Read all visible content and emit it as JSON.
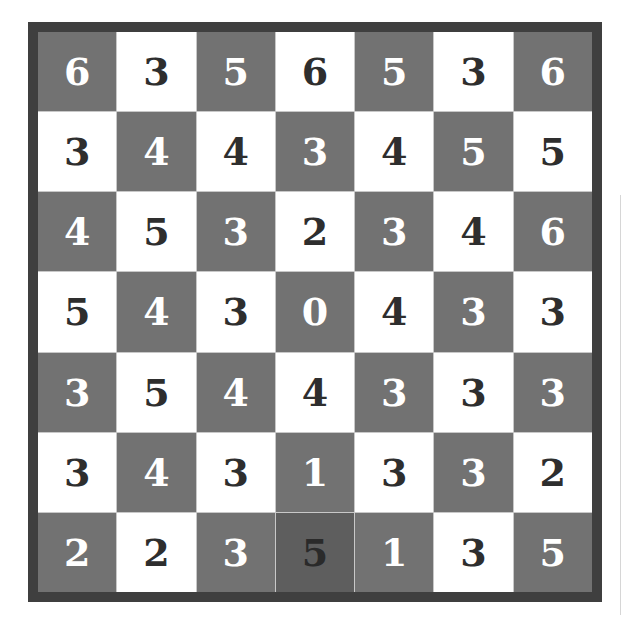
{
  "board": {
    "rows": 7,
    "cols": 7,
    "values": [
      [
        6,
        3,
        5,
        6,
        5,
        3,
        6
      ],
      [
        3,
        4,
        4,
        3,
        4,
        5,
        5
      ],
      [
        4,
        5,
        3,
        2,
        3,
        4,
        6
      ],
      [
        5,
        4,
        3,
        0,
        4,
        3,
        3
      ],
      [
        3,
        5,
        4,
        4,
        3,
        3,
        3
      ],
      [
        3,
        4,
        3,
        1,
        3,
        3,
        2
      ],
      [
        2,
        2,
        3,
        5,
        1,
        3,
        5
      ]
    ],
    "highlighted_cell": {
      "row": 6,
      "col": 3
    },
    "colors": {
      "frame": "#3f3f3f",
      "dark_cell": "#727272",
      "light_cell": "#ffffff",
      "highlight_cell": "#5e5e5e",
      "dark_text": "#2e2e2e",
      "light_text": "#ffffff"
    }
  }
}
